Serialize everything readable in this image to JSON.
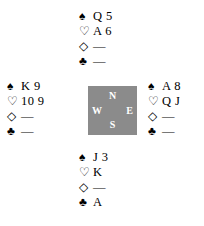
{
  "diagram": {
    "type": "bridge-hand-diagram",
    "background_color": "#ffffff",
    "text_color": "#000000"
  },
  "suits": {
    "spade": {
      "symbol": "♠",
      "name": "spade-symbol"
    },
    "heart": {
      "symbol": "♡",
      "name": "heart-symbol"
    },
    "diamond": {
      "symbol": "◇",
      "name": "diamond-symbol"
    },
    "club": {
      "symbol": "♣",
      "name": "club-symbol"
    }
  },
  "compass": {
    "box_color": "#8b8b8b",
    "label_color": "#ffffff",
    "north": "N",
    "west": "W",
    "east": "E",
    "south": "S"
  },
  "hands": {
    "north": {
      "position": "North",
      "spades": "Q 5",
      "hearts": "A 6",
      "diamonds": "—",
      "clubs": "—"
    },
    "west": {
      "position": "West",
      "spades": "K 9",
      "hearts": "10 9",
      "diamonds": "—",
      "clubs": "—"
    },
    "east": {
      "position": "East",
      "spades": "A 8",
      "hearts": "Q J",
      "diamonds": "—",
      "clubs": "—"
    },
    "south": {
      "position": "South",
      "spades": "J 3",
      "hearts": "K",
      "diamonds": "—",
      "clubs": "A"
    }
  }
}
